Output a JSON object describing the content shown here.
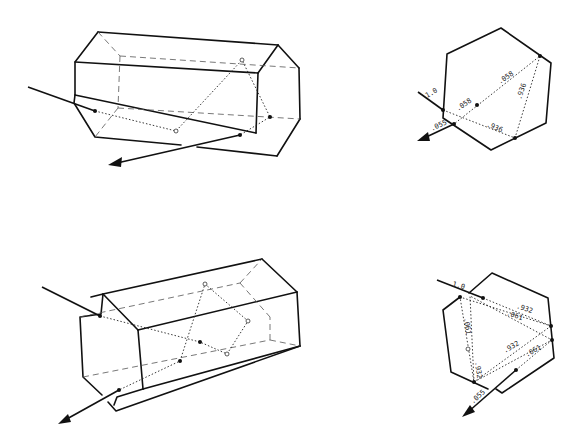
{
  "figure": {
    "panels": [
      {
        "id": "top-left",
        "type": "3d-hexagonal-prism",
        "content": "Incident ray refracted through prism, internally reflected, exits"
      },
      {
        "id": "top-right",
        "type": "hexagon-cross-section",
        "labels": {
          "incident": "1.0",
          "seg_a1": ".058",
          "seg_a2": ".058",
          "seg_b": ".936",
          "seg_c": ".936",
          "exit": ".055"
        }
      },
      {
        "id": "bottom-left",
        "type": "3d-hexagonal-prism",
        "content": "Incident ray with multiple internal reflections, exits"
      },
      {
        "id": "bottom-right",
        "type": "hexagon-cross-section",
        "labels": {
          "incident": "1.0",
          "seg_top_a": ".932",
          "seg_top_b": ".061",
          "seg_left_a": ".061",
          "seg_left_b": ".932",
          "seg_bottom_a": ".932",
          "seg_bottom_b": ".061",
          "exit": ".055"
        }
      }
    ]
  },
  "colors": {
    "line": "#111111",
    "background": "#ffffff"
  }
}
